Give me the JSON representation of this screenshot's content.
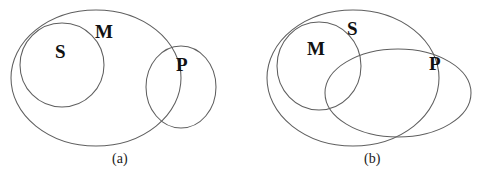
{
  "figure": {
    "type": "venn-diagram-pair",
    "background_color": "#ffffff",
    "stroke_color": "#5f5f5f",
    "label_color": "#111111",
    "panels": [
      {
        "id": "a",
        "caption": "(a)",
        "caption_x": 112,
        "caption_y": 152,
        "shapes": [
          {
            "name": "m-ellipse",
            "label": "M",
            "kind": "ellipse",
            "cx": 96,
            "cy": 78,
            "rx": 85,
            "ry": 68,
            "rotate": 0
          },
          {
            "name": "s-circle",
            "label": "S",
            "kind": "ellipse",
            "cx": 62,
            "cy": 65,
            "rx": 42,
            "ry": 42,
            "rotate": 0
          },
          {
            "name": "p-circle",
            "label": "P",
            "kind": "ellipse",
            "cx": 181,
            "cy": 87,
            "rx": 35,
            "ry": 41,
            "rotate": 0
          }
        ],
        "labels": [
          {
            "name": "label-s",
            "text": "S",
            "x": 55,
            "y": 42
          },
          {
            "name": "label-m",
            "text": "M",
            "x": 95,
            "y": 22
          },
          {
            "name": "label-p",
            "text": "P",
            "x": 176,
            "y": 55
          }
        ]
      },
      {
        "id": "b",
        "caption": "(b)",
        "caption_x": 364,
        "caption_y": 152,
        "shapes": [
          {
            "name": "s-ellipse",
            "label": "S",
            "kind": "ellipse",
            "cx": 353,
            "cy": 78,
            "rx": 86,
            "ry": 68,
            "rotate": 0
          },
          {
            "name": "m-circle",
            "label": "M",
            "kind": "ellipse",
            "cx": 319,
            "cy": 66,
            "rx": 42,
            "ry": 44,
            "rotate": 0
          },
          {
            "name": "p-ellipse",
            "label": "P",
            "kind": "ellipse",
            "cx": 398,
            "cy": 93,
            "rx": 73,
            "ry": 44,
            "rotate": 0
          }
        ],
        "labels": [
          {
            "name": "label-m",
            "text": "M",
            "x": 307,
            "y": 39
          },
          {
            "name": "label-s",
            "text": "S",
            "x": 347,
            "y": 19
          },
          {
            "name": "label-p",
            "text": "P",
            "x": 429,
            "y": 54
          }
        ]
      }
    ]
  }
}
